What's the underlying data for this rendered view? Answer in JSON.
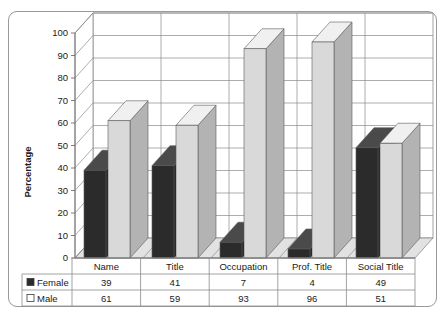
{
  "chart_data": {
    "type": "bar",
    "title": "",
    "subtitle": "",
    "xlabel": "",
    "ylabel": "Percentage",
    "ylim": [
      0,
      100
    ],
    "ytick_step": 10,
    "yticks": [
      "0",
      "10",
      "20",
      "30",
      "40",
      "50",
      "60",
      "70",
      "80",
      "90",
      "100"
    ],
    "grid": true,
    "legend_position": "data-table-left",
    "three_d": true,
    "categories": [
      "Name",
      "Title",
      "Occupation",
      "Prof. Title",
      "Social Title"
    ],
    "series": [
      {
        "name": "Female",
        "values": [
          39,
          41,
          7,
          4,
          49
        ],
        "color": "#2b2b2b",
        "swatch": "filled-square"
      },
      {
        "name": "Male",
        "values": [
          61,
          59,
          93,
          96,
          51
        ],
        "color": "#d9d9d9",
        "swatch": "open-square"
      }
    ],
    "data_table": {
      "row_headers": [
        "Female",
        "Male"
      ],
      "columns": [
        "Name",
        "Title",
        "Occupation",
        "Prof. Title",
        "Social Title"
      ],
      "rows": [
        [
          "39",
          "41",
          "7",
          "4",
          "49"
        ],
        [
          "61",
          "59",
          "93",
          "96",
          "51"
        ]
      ]
    }
  },
  "colors": {
    "female_face": "#2b2b2b",
    "female_top": "#4a4a4a",
    "female_side": "#171717",
    "male_face": "#d9d9d9",
    "male_top": "#f0f0f0",
    "male_side": "#b3b3b3",
    "floor": "#e2e2e2",
    "wall": "#ffffff",
    "grid": "#8a8a8a",
    "frame": "#999999",
    "text": "#1a1a1a"
  }
}
